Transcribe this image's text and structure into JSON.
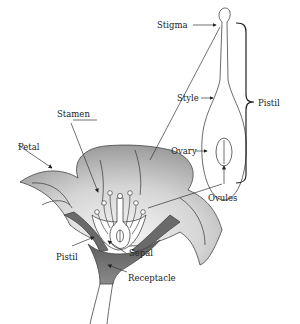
{
  "diagram": {
    "labels": {
      "stigma": "Stigma",
      "style": "Style",
      "pistil_bracket": "Pistil",
      "ovary": "Ovary",
      "ovules": "Ovules",
      "stamen": "Stamen",
      "petal": "Petal",
      "pistil_flower": "Pistil",
      "sepal": "Sepal",
      "receptacle": "Receptacle"
    },
    "colors": {
      "petal_light": "#f4f4f4",
      "petal_dark": "#a8a8a8",
      "sepal": "#6e6e6e",
      "receptacle": "#7a7a7a",
      "outline": "#444444",
      "text": "#222222"
    }
  }
}
